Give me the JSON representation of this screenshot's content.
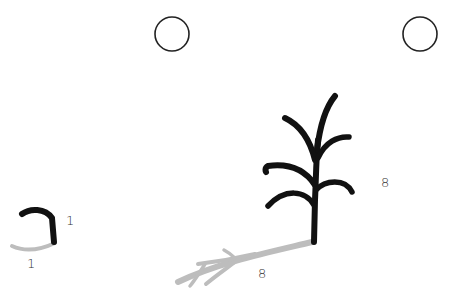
{
  "colors": {
    "plant": "#111111",
    "shadow": "#bdbdbd",
    "circle": "#222222",
    "label": "#333333",
    "background": "#ffffff"
  },
  "circles": [
    {
      "name": "sun-circle-left",
      "cx": 172,
      "cy": 34,
      "r": 17
    },
    {
      "name": "sun-circle-right",
      "cx": 420,
      "cy": 34,
      "r": 17
    }
  ],
  "figures": [
    {
      "name": "seedling",
      "height_label": "1",
      "shadow_label": "1"
    },
    {
      "name": "mature-plant",
      "height_label": "8",
      "shadow_label": "8"
    }
  ]
}
